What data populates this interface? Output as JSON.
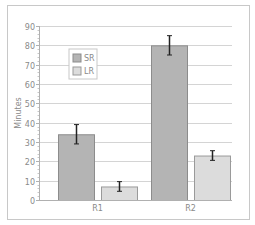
{
  "chart_data": {
    "type": "bar",
    "title": "",
    "xlabel": "",
    "ylabel": "Minutes",
    "ylim": [
      0,
      90
    ],
    "yticks": [
      0,
      10,
      20,
      30,
      40,
      50,
      60,
      70,
      80,
      90
    ],
    "grid": true,
    "legend_position": "upper-left inside",
    "categories": [
      "R1",
      "R2"
    ],
    "series": [
      {
        "name": "SR",
        "values": [
          34,
          80
        ],
        "error": [
          5,
          5
        ],
        "color": "#b4b4b4",
        "border": "#8c8c8c"
      },
      {
        "name": "LR",
        "values": [
          7,
          23
        ],
        "error": [
          2.5,
          2.5
        ],
        "color": "#dcdcdc",
        "border": "#9a9a9a"
      }
    ]
  },
  "legend": {
    "items": [
      {
        "label": "SR"
      },
      {
        "label": "LR"
      }
    ]
  },
  "axis": {
    "ylabel": "Minutes",
    "ticks": [
      "0",
      "10",
      "20",
      "30",
      "40",
      "50",
      "60",
      "70",
      "80",
      "90"
    ],
    "categories": [
      "R1",
      "R2"
    ]
  }
}
